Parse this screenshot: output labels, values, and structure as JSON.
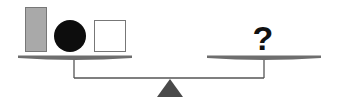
{
  "diagram": {
    "type": "balance-scale-puzzle",
    "left_pan": {
      "items": [
        {
          "shape": "rectangle",
          "fill": "#a9a9a9",
          "stroke": "#666666"
        },
        {
          "shape": "circle",
          "fill": "#0d0d0d",
          "stroke": "#0d0d0d"
        },
        {
          "shape": "square",
          "fill": "#ffffff",
          "stroke": "#666666"
        }
      ]
    },
    "right_pan": {
      "label": "?"
    },
    "colors": {
      "beam": "#555555",
      "pan": "#6e6e6e",
      "fulcrum": "#4a4a4a"
    }
  }
}
